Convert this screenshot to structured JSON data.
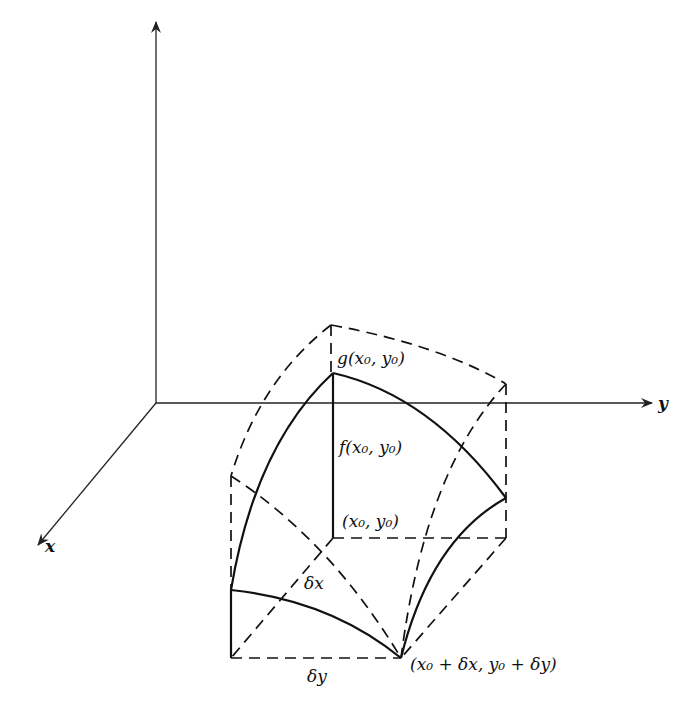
{
  "diagram": {
    "type": "3d-surface-volume-element",
    "axes": {
      "x_label": "x",
      "y_label": "y",
      "z_label": ""
    },
    "labels": {
      "g_point": "g(x₀, y₀)",
      "f_point": "f(x₀, y₀)",
      "base_point": "(x₀, y₀)",
      "corner_point": "(x₀ + δx, y₀ + δy)",
      "delta_x": "δx",
      "delta_y": "δy"
    },
    "line_color": "#111111",
    "background": "#ffffff"
  }
}
